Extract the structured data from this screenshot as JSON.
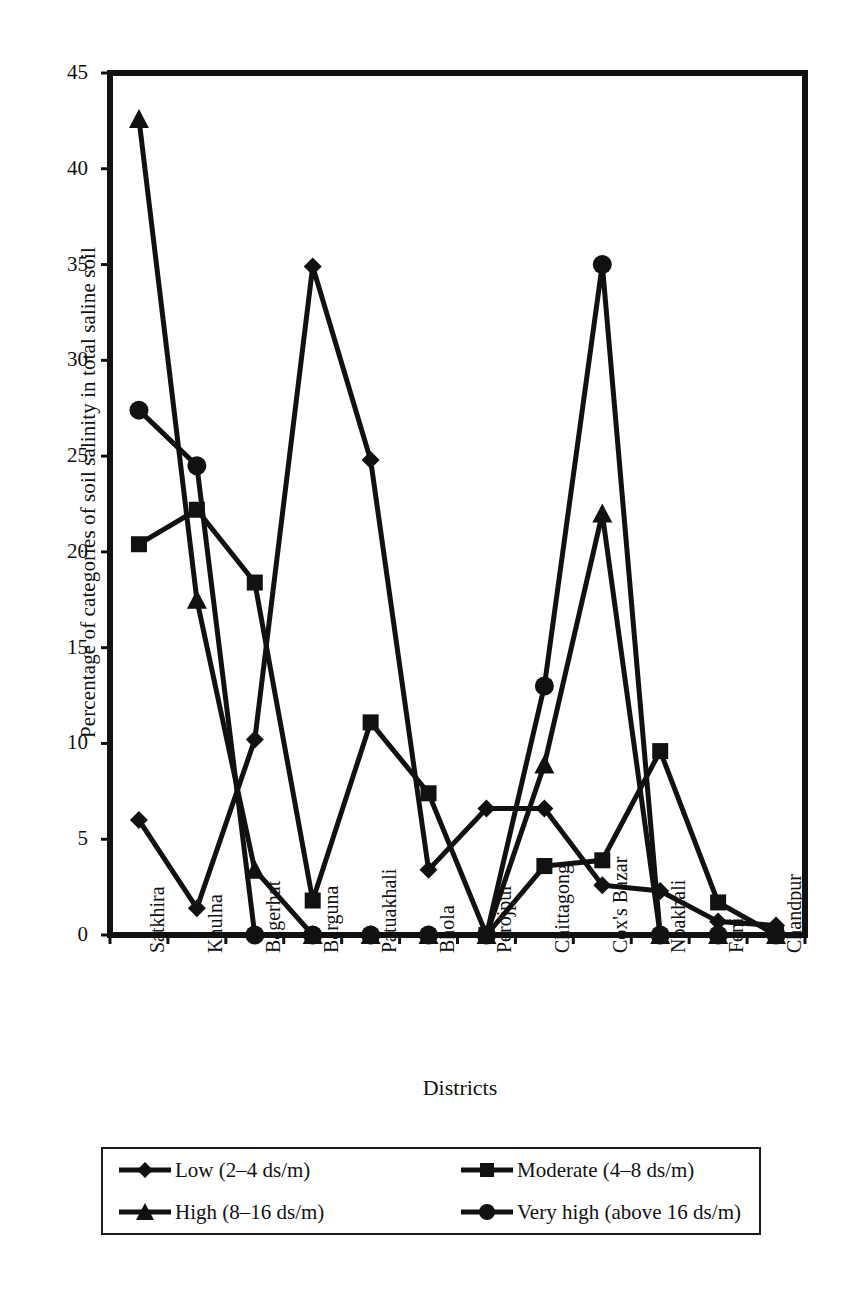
{
  "chart_data": {
    "type": "line",
    "title": "",
    "xlabel": "Districts",
    "ylabel": "Percentage of categories of soil salinity in total saline soil",
    "categories": [
      "Satkhira",
      "Khulna",
      "Bagerhat",
      "Barguna",
      "Patuakhali",
      "Bhola",
      "Perojpur",
      "Chittagong",
      "Cox's Bazar",
      "Noakhali",
      "Feni",
      "Chandpur"
    ],
    "ylim": [
      0,
      45
    ],
    "yticks": [
      0,
      5,
      10,
      15,
      20,
      25,
      30,
      35,
      40,
      45
    ],
    "ytick_labels": [
      "0",
      "5",
      "10",
      "15",
      "20",
      "25",
      "30",
      "35",
      "40",
      "45"
    ],
    "grid": false,
    "legend_position": "below-plot",
    "series": [
      {
        "name": "Low (2–4 ds/m)",
        "marker": "diamond",
        "color": "#111111",
        "values": [
          6.0,
          1.4,
          10.2,
          34.9,
          24.8,
          3.4,
          6.6,
          6.6,
          2.6,
          2.3,
          0.7,
          0.5
        ]
      },
      {
        "name": "Moderate (4–8 ds/m)",
        "marker": "square",
        "color": "#111111",
        "values": [
          20.4,
          22.2,
          18.4,
          1.8,
          11.1,
          7.4,
          0.0,
          3.6,
          3.9,
          9.6,
          1.7,
          0.0
        ]
      },
      {
        "name": "High (8–16 ds/m)",
        "marker": "triangle",
        "color": "#111111",
        "values": [
          42.6,
          17.5,
          3.4,
          0.0,
          0.0,
          0.0,
          0.0,
          8.9,
          22.0,
          0.0,
          0.0,
          0.0
        ]
      },
      {
        "name": "Very high (above 16 ds/m)",
        "marker": "circle",
        "color": "#111111",
        "values": [
          27.4,
          24.5,
          0.0,
          0.0,
          0.0,
          0.0,
          0.0,
          13.0,
          35.0,
          0.0,
          0.0,
          0.0
        ]
      }
    ]
  },
  "legend": {
    "entries": [
      {
        "label": "Low (2–4 ds/m)",
        "marker": "diamond"
      },
      {
        "label": "Moderate (4–8 ds/m)",
        "marker": "square"
      },
      {
        "label": "High (8–16 ds/m)",
        "marker": "triangle"
      },
      {
        "label": "Very high (above 16 ds/m)",
        "marker": "circle"
      }
    ]
  }
}
